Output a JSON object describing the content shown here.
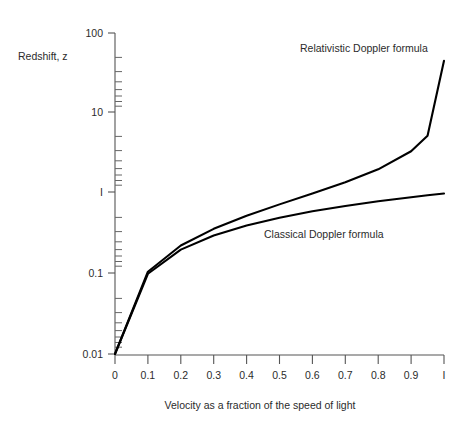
{
  "chart_data": {
    "type": "line",
    "title": "",
    "xlabel": "Velocity as a fraction of the speed of light",
    "ylabel": "Redshift, z",
    "yscale": "log",
    "xscale": "linear",
    "xlim": [
      0,
      1
    ],
    "ylim": [
      0.01,
      100
    ],
    "grid": false,
    "legend_position": "inline-annotations",
    "x_tick_labels": [
      "0",
      "0.1",
      "0.2",
      "0.3",
      "0.4",
      "0.5",
      "0.6",
      "0.7",
      "0.8",
      "0.9",
      "I"
    ],
    "x_tick_values": [
      0,
      0.1,
      0.2,
      0.3,
      0.4,
      0.5,
      0.6,
      0.7,
      0.8,
      0.9,
      1
    ],
    "y_tick_labels": [
      "100",
      "10",
      "I",
      "0.1",
      "0.01"
    ],
    "y_tick_values": [
      100,
      10,
      1,
      0.1,
      0.01
    ],
    "x": [
      0,
      0.1,
      0.2,
      0.3,
      0.4,
      0.5,
      0.6,
      0.7,
      0.8,
      0.9,
      0.95,
      1
    ],
    "series": [
      {
        "name": "Relativistic Doppler formula",
        "annotation": "Relativistic Doppler formula",
        "values": [
          0.01,
          0.106,
          0.225,
          0.363,
          0.528,
          0.732,
          1.0,
          1.38,
          2.0,
          3.36,
          5.24,
          45
        ]
      },
      {
        "name": "Classical Doppler formula",
        "annotation": "Classical Doppler formula",
        "values": [
          0.01,
          0.1,
          0.2,
          0.3,
          0.4,
          0.5,
          0.6,
          0.7,
          0.8,
          0.9,
          0.95,
          1.0
        ]
      }
    ],
    "annotations": [
      {
        "text": "Relativistic Doppler formula",
        "x_px": 300,
        "y_px": 52
      },
      {
        "text": "Classical Doppler formula",
        "x_px": 264,
        "y_px": 238
      }
    ]
  }
}
